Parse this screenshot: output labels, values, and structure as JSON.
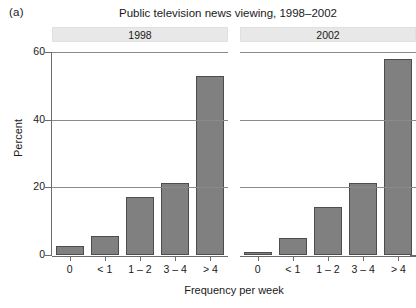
{
  "figure": {
    "panel_letter": "(a)",
    "title": "Public television news viewing, 1998–2002"
  },
  "chart_data": {
    "type": "bar",
    "title": "Public television news viewing, 1998–2002",
    "xlabel": "Frequency per week",
    "ylabel": "Percent",
    "ylim": [
      0,
      60
    ],
    "yticks": [
      0,
      20,
      40,
      60
    ],
    "grid": true,
    "legend": "none",
    "layout": "two side-by-side panels (lattice strips)",
    "categories": [
      "0",
      "< 1",
      "1 – 2",
      "3 – 4",
      "> 4"
    ],
    "panels": [
      {
        "strip_label": "1998",
        "values": [
          2.8,
          5.7,
          17.2,
          21.4,
          53.0
        ]
      },
      {
        "strip_label": "2002",
        "values": [
          0.8,
          5.1,
          14.3,
          21.4,
          58.0
        ]
      }
    ],
    "series": [
      {
        "name": "1998",
        "values": [
          2.8,
          5.7,
          17.2,
          21.4,
          53.0
        ]
      },
      {
        "name": "2002",
        "values": [
          0.8,
          5.1,
          14.3,
          21.4,
          58.0
        ]
      }
    ],
    "colors": {
      "bar_fill": "#808080",
      "bar_edge": "#4d4d4d",
      "gridline": "#8a8a8a",
      "axis": "#6b6b6b",
      "strip_background": "#e8e8e8",
      "text": "#1a1a1a",
      "background": "#ffffff"
    }
  },
  "axes": {
    "y_tick_labels": [
      "0",
      "20",
      "40",
      "60"
    ],
    "y_title": "Percent",
    "x_tick_labels": [
      "0",
      "< 1",
      "1 – 2",
      "3 – 4",
      "> 4"
    ],
    "x_title": "Frequency per week"
  }
}
